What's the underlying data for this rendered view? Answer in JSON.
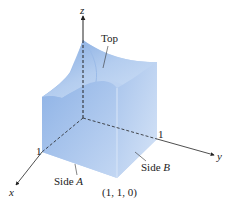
{
  "figure": {
    "type": "3d-solid-diagram",
    "colors": {
      "solid_light": "#c9dcf5",
      "solid_mid": "#9dbde8",
      "solid_dark": "#6f98d4",
      "axis": "#222222"
    }
  },
  "axes": {
    "x": {
      "label": "x",
      "tick": "1"
    },
    "y": {
      "label": "y",
      "tick": "1"
    },
    "z": {
      "label": "z"
    }
  },
  "labels": {
    "top": "Top",
    "side_a_prefix": "Side ",
    "side_a_letter": "A",
    "side_b_prefix": "Side ",
    "side_b_letter": "B",
    "corner": "(1, 1, 0)"
  }
}
